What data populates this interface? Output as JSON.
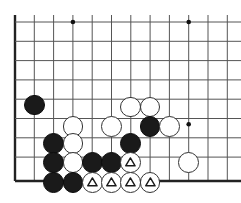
{
  "diagram": {
    "board_type": "go-board-partial",
    "geometry": {
      "width": 241,
      "height": 203,
      "origin_x": 15,
      "origin_y": 22,
      "spacing": 19.3,
      "cols": 12,
      "rows": 9,
      "stone_radius": 10.4,
      "edge_left_x": 15,
      "edge_bottom_y": 181
    },
    "colors": {
      "background": "#ffffff",
      "line": "#555555",
      "edge_line": "#222222",
      "black_stone": "#1a1a1a",
      "white_stone": "#ffffff",
      "white_stone_border": "#333333",
      "hoshi": "#111111"
    },
    "hoshi_points": [
      {
        "col": 3,
        "row": 0,
        "label": "star-point-upper-left"
      },
      {
        "col": 9,
        "row": 0,
        "label": "star-point-upper-right"
      },
      {
        "col": 9,
        "row": 5,
        "label": "star-point-lower-right"
      }
    ],
    "stones": [
      {
        "id": "b1",
        "color": "black",
        "col": 1,
        "row": 4.3,
        "mark": "none",
        "label": "black-stone"
      },
      {
        "id": "w1",
        "color": "white",
        "col": 3,
        "row": 5.4,
        "mark": "none",
        "label": "white-stone"
      },
      {
        "id": "w2",
        "color": "white",
        "col": 5,
        "row": 5.4,
        "mark": "none",
        "label": "white-stone"
      },
      {
        "id": "w3",
        "color": "white",
        "col": 6,
        "row": 4.4,
        "mark": "none",
        "label": "white-stone"
      },
      {
        "id": "w4",
        "color": "white",
        "col": 7,
        "row": 4.4,
        "mark": "none",
        "label": "white-stone"
      },
      {
        "id": "b2",
        "color": "black",
        "col": 7,
        "row": 5.4,
        "mark": "none",
        "label": "black-stone"
      },
      {
        "id": "w5",
        "color": "white",
        "col": 8,
        "row": 5.4,
        "mark": "none",
        "label": "white-stone"
      },
      {
        "id": "b3",
        "color": "black",
        "col": 2,
        "row": 6.3,
        "mark": "none",
        "label": "black-stone"
      },
      {
        "id": "w6",
        "color": "white",
        "col": 3,
        "row": 6.3,
        "mark": "none",
        "label": "white-stone"
      },
      {
        "id": "b4",
        "color": "black",
        "col": 6,
        "row": 6.3,
        "mark": "none",
        "label": "black-stone"
      },
      {
        "id": "b5",
        "color": "black",
        "col": 2,
        "row": 7.3,
        "mark": "none",
        "label": "black-stone"
      },
      {
        "id": "w7",
        "color": "white",
        "col": 3,
        "row": 7.3,
        "mark": "none",
        "label": "white-stone"
      },
      {
        "id": "b6",
        "color": "black",
        "col": 4,
        "row": 7.3,
        "mark": "none",
        "label": "black-stone"
      },
      {
        "id": "b7",
        "color": "black",
        "col": 5,
        "row": 7.3,
        "mark": "none",
        "label": "black-stone"
      },
      {
        "id": "w8",
        "color": "white",
        "col": 6,
        "row": 7.3,
        "mark": "triangle",
        "label": "white-stone-triangle"
      },
      {
        "id": "w9",
        "color": "white",
        "col": 9,
        "row": 7.3,
        "mark": "none",
        "label": "white-stone"
      },
      {
        "id": "b8",
        "color": "black",
        "col": 2,
        "row": 8.3,
        "mark": "none",
        "label": "black-stone"
      },
      {
        "id": "b9",
        "color": "black",
        "col": 3,
        "row": 8.3,
        "mark": "none",
        "label": "black-stone"
      },
      {
        "id": "w10",
        "color": "white",
        "col": 4,
        "row": 8.3,
        "mark": "triangle",
        "label": "white-stone-triangle"
      },
      {
        "id": "w11",
        "color": "white",
        "col": 5,
        "row": 8.3,
        "mark": "triangle",
        "label": "white-stone-triangle"
      },
      {
        "id": "w12",
        "color": "white",
        "col": 6,
        "row": 8.3,
        "mark": "triangle",
        "label": "white-stone-triangle"
      },
      {
        "id": "w13",
        "color": "white",
        "col": 7,
        "row": 8.3,
        "mark": "triangle",
        "label": "white-stone-triangle"
      }
    ]
  }
}
